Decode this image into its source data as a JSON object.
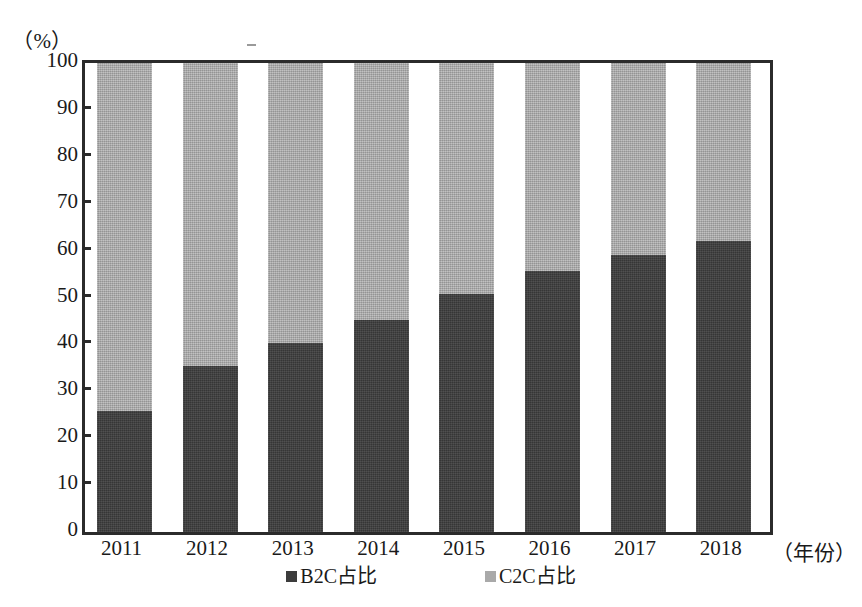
{
  "chart_data": {
    "type": "bar",
    "subtype": "stacked-100-percent",
    "title": "",
    "xlabel": "（年份）",
    "ylabel": "（%）",
    "categories": [
      "2011",
      "2012",
      "2013",
      "2014",
      "2015",
      "2016",
      "2017",
      "2018"
    ],
    "series": [
      {
        "name": "B2C占比",
        "color": "#3c3c3c",
        "values": [
          25.8,
          35.4,
          40.3,
          45.2,
          50.7,
          55.7,
          59.0,
          62.0
        ]
      },
      {
        "name": "C2C占比",
        "color": "#a9a9a9",
        "values": [
          74.2,
          64.6,
          59.7,
          54.8,
          49.3,
          44.3,
          41.0,
          38.0
        ]
      }
    ],
    "ylim": [
      0,
      100
    ],
    "ytick_values": [
      0,
      10,
      20,
      30,
      40,
      50,
      60,
      70,
      80,
      90,
      100
    ],
    "ytick_labels": [
      "0",
      "10",
      "20",
      "30",
      "40",
      "50",
      "60",
      "70",
      "80",
      "90",
      "100"
    ],
    "grid": false,
    "legend_position": "bottom",
    "stacked": true
  },
  "axes": {
    "y_unit_label": "（%）",
    "x_unit_label": "（年份）"
  },
  "legend": {
    "items": [
      {
        "label": "B2C占比",
        "swatch": "dark-square-swatch"
      },
      {
        "label": "C2C占比",
        "swatch": "light-square-swatch"
      }
    ]
  }
}
